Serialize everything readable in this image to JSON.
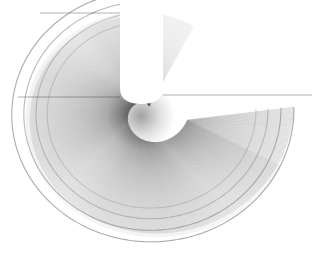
{
  "figure": {
    "title": "Spiral string-art envelope",
    "type": "line-envelope",
    "background_color": "#ffffff",
    "stroke_color": "#4a4a4a",
    "accent_color": "#1e1e1e",
    "width": 321,
    "height": 256
  },
  "chart_data": {
    "type": "line",
    "title": "Spiral string-art envelope",
    "xlabel": "",
    "ylabel": "",
    "grid": false,
    "legend": "none",
    "xlim": [
      0,
      321
    ],
    "ylim": [
      0,
      256
    ],
    "render": {
      "stroke_color": "#4a4a4a",
      "stroke_width": 0.35,
      "stroke_opacity": 0.55,
      "background": "#ffffff"
    },
    "generator": {
      "model": "rotating-chord-envelope",
      "note": "Each segment runs from a point on an inner spiral (pivot track) to a point on an outer spiral (rim track). Angle steps uniformly; radii grow with angle producing the spiral caustic.",
      "segment_count": 520,
      "angle_start_deg": 90,
      "angle_sweep_deg": 272,
      "angle_direction": "clockwise"
    },
    "center": {
      "x": 148,
      "y": 112
    },
    "pivot_track": {
      "name": "inner spiral",
      "radius_start": 6,
      "radius_end": 40,
      "radius_growth": "linear",
      "phase_offset_deg": -14
    },
    "rim_track": {
      "name": "outer spiral",
      "radius_start": 104,
      "radius_end": 146,
      "radius_growth": "linear",
      "phase_offset_deg": 0
    },
    "bands": [
      {
        "name": "outer-rim-band",
        "radius": 146,
        "darkness": 0.85
      },
      {
        "name": "second-band",
        "radius": 133,
        "darkness": 0.7
      },
      {
        "name": "third-band",
        "radius": 120,
        "darkness": 0.5
      },
      {
        "name": "inner-band",
        "radius": 108,
        "darkness": 0.35
      }
    ],
    "notch": {
      "name": "upper cut-out wedge",
      "left_edge_x": 120,
      "right_edge_x": 163,
      "top_y": 13,
      "bottom_y": 104,
      "shape": "vertical-sided lobe with rounded base"
    },
    "straight_edges": [
      {
        "name": "top-edge",
        "x1": 40,
        "y1": 13,
        "x2": 122,
        "y2": 13
      },
      {
        "name": "right-edge",
        "x1": 163,
        "y1": 95,
        "x2": 312,
        "y2": 95
      },
      {
        "name": "mid-left-chord",
        "x1": 18,
        "y1": 97,
        "x2": 120,
        "y2": 97
      }
    ],
    "focus_point": {
      "x": 141,
      "y": 116,
      "label": "caustic focus"
    },
    "extent": {
      "left": 8,
      "right": 313,
      "top": 12,
      "bottom": 246
    }
  }
}
